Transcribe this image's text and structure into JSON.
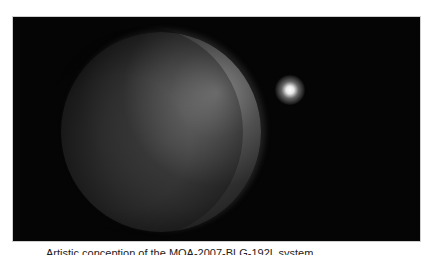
{
  "figure": {
    "elements": [
      "planet",
      "host-star",
      "starfield"
    ]
  },
  "caption": {
    "text": "Artistic conception of the MOA-2007-BLG-192L system"
  }
}
